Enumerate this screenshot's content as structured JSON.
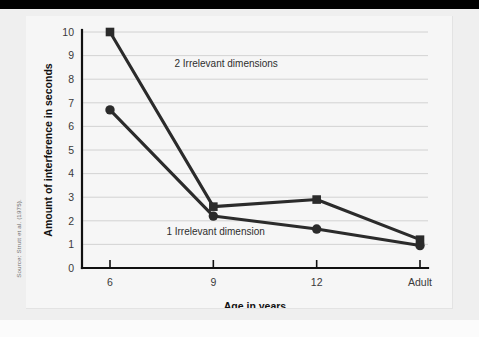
{
  "source_credit": "Source: Strutt et al. (1975).",
  "chart_data": {
    "type": "line",
    "title": "",
    "xlabel": "Age in years",
    "ylabel": "Amount of interference in seconds",
    "categories": [
      "6",
      "9",
      "12",
      "Adult"
    ],
    "ylim": [
      0,
      10
    ],
    "yticks": [
      "0",
      "1",
      "2",
      "3",
      "4",
      "5",
      "6",
      "7",
      "8",
      "9",
      "10"
    ],
    "grid": true,
    "legend_position": "inline-annotation",
    "series": [
      {
        "name": "2 Irrelevant dimensions",
        "marker": "square",
        "values": [
          10,
          2.6,
          2.9,
          1.2
        ]
      },
      {
        "name": "1 Irrelevant dimension",
        "marker": "circle",
        "values": [
          6.7,
          2.2,
          1.65,
          0.95
        ]
      }
    ],
    "annotations": [
      {
        "text": "2 Irrelevant dimensions",
        "x": 1.2,
        "y": 8.7
      },
      {
        "text": "1 Irrelevant dimension",
        "x": 1.05,
        "y": 1.55
      }
    ],
    "colors": {
      "line": "#2b2b2b",
      "grid": "#c9c9c9",
      "axis": "#111111",
      "plot_background": "#f6f6f6",
      "page_background": "#efefef",
      "top_bar": "#000000"
    }
  }
}
